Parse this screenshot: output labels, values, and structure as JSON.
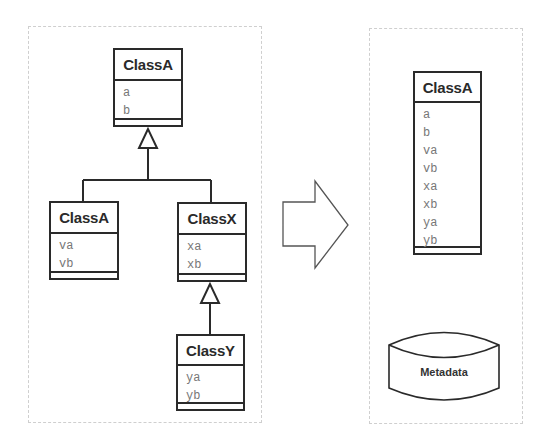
{
  "left_panel": {
    "base_class": {
      "name": "ClassA",
      "attributes": [
        "a",
        "b"
      ]
    },
    "child_left": {
      "name": "ClassA",
      "attributes": [
        "va",
        "vb"
      ]
    },
    "child_right": {
      "name": "ClassX",
      "attributes": [
        "xa",
        "xb"
      ]
    },
    "grandchild": {
      "name": "ClassY",
      "attributes": [
        "ya",
        "yb"
      ]
    }
  },
  "arrow": {
    "direction": "right",
    "icon": "block-arrow-right-icon"
  },
  "right_panel": {
    "merged_class": {
      "name": "ClassA",
      "attributes": [
        "a",
        "b",
        "va",
        "vb",
        "xa",
        "xb",
        "ya",
        "yb"
      ]
    },
    "datastore": {
      "label": "Metadata",
      "icon": "database-cylinder-icon"
    }
  },
  "colors": {
    "line": "#2a2a2a",
    "attr_text": "#777777",
    "panel_border": "#cfcfcf"
  }
}
